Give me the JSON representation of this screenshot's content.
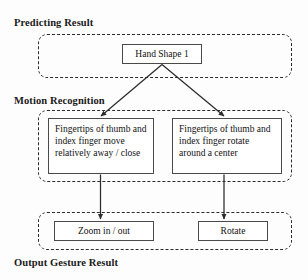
{
  "diagram": {
    "sections": [
      {
        "id": "predicting",
        "label": "Predicting Result"
      },
      {
        "id": "motion",
        "label": "Motion Recognition"
      },
      {
        "id": "output",
        "label": "Output Gesture Result"
      }
    ],
    "nodes": {
      "hand_shape": "Hand Shape 1",
      "motion_left": "Fingertips of thumb and index finger move relatively away / close",
      "motion_right": "Fingertips of thumb and index finger rotate around a center",
      "output_left": "Zoom in / out",
      "output_right": "Rotate"
    },
    "colors": {
      "stroke": "#2b2b2b",
      "node_border": "#4a4a4a",
      "text": "#111111",
      "background": "#ffffff"
    }
  }
}
